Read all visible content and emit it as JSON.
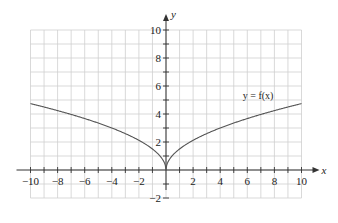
{
  "chart_data": {
    "type": "line",
    "title": "",
    "xlabel": "x",
    "ylabel": "y",
    "xlim": [
      -10,
      10
    ],
    "ylim": [
      -2,
      10
    ],
    "grid": true,
    "grid_step": 1,
    "x_ticks": [
      -10,
      -8,
      -6,
      -4,
      -2,
      2,
      4,
      6,
      8,
      10
    ],
    "x_tick_labels": [
      "−10",
      "−8",
      "−6",
      "−4",
      "−2",
      "2",
      "4",
      "6",
      "8",
      "10"
    ],
    "y_ticks": [
      -2,
      2,
      4,
      6,
      8,
      10
    ],
    "y_tick_labels": [
      "−2",
      "2",
      "4",
      "6",
      "8",
      "10"
    ],
    "series": [
      {
        "name": "y = f(x)",
        "x": [
          -10,
          -8,
          -6,
          -4,
          -2,
          -1,
          -0.5,
          0,
          0.5,
          1,
          2,
          4,
          6,
          8,
          10
        ],
        "values": [
          4.7,
          4.2,
          3.7,
          3.0,
          2.1,
          1.5,
          1.06,
          0,
          1.06,
          1.5,
          2.1,
          3.0,
          3.7,
          4.2,
          4.7
        ]
      }
    ],
    "annotations": [
      {
        "text": "y = f(x)",
        "x": 6.8,
        "y": 5.1
      }
    ],
    "legend": "none"
  }
}
